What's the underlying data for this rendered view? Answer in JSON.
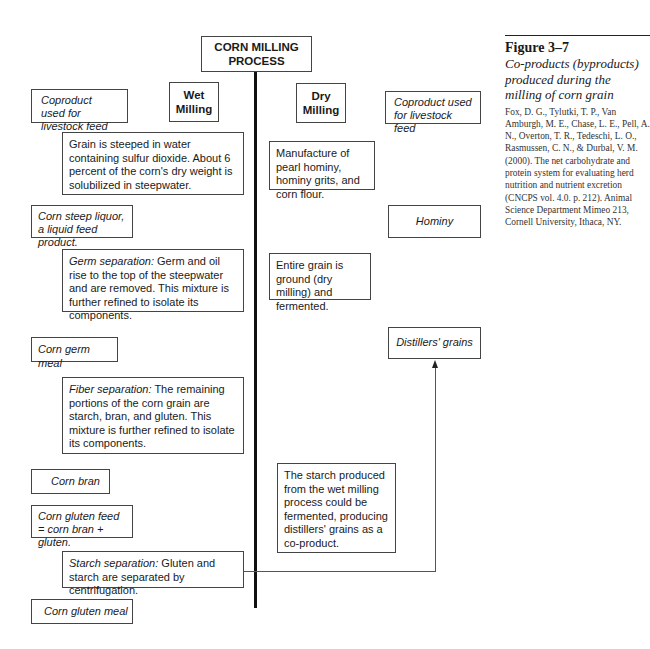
{
  "title": "CORN MILLING PROCESS",
  "wet_heading": "Wet Milling",
  "dry_heading": "Dry Milling",
  "wet": {
    "coproduct_label": "Coproduct used for livestock feed",
    "steps": [
      {
        "lead": "",
        "text": "Grain is steeped in water containing sulfur dioxide.  About 6 percent of the corn's dry weight is solubilized in steepwater."
      },
      {
        "lead": "Germ separation:",
        "text": "  Germ and oil rise to the top of the steepwater and are removed.  This mixture is further refined to isolate its components."
      },
      {
        "lead": "Fiber separation:",
        "text": " The remaining portions of the corn grain are starch, bran, and gluten. This mixture is further refined to isolate its components."
      },
      {
        "lead": "Starch separation:",
        "text": " Gluten and starch are separated by centrifugation."
      }
    ],
    "coproducts": [
      "Corn steep liquor, a liquid feed product.",
      "Corn germ meal",
      "Corn bran",
      "Corn gluten feed = corn bran + gluten.",
      "Corn gluten meal"
    ]
  },
  "dry": {
    "coproduct_label": "Coproduct used for livestock feed",
    "steps": [
      "Manufacture of pearl hominy, hominy grits, and corn flour.",
      "Entire grain is ground (dry milling) and fermented.",
      "The starch produced from the wet milling process could be fermented, producing distillers' grains as a co-product."
    ],
    "coproducts": [
      "Hominy",
      "Distillers' grains"
    ]
  },
  "caption": {
    "figure_number": "Figure 3–7",
    "figure_title": "Co-products (byproducts) produced during the milling of corn grain",
    "citation": "Fox, D. G., Tylutki, T. P., Van Amburgh, M. E., Chase, L. E., Pell, A. N., Overton, T. R., Tedeschi, L. O., Rasmussen, C. N., & Durbal, V. M. (2000). The net carbohydrate and protein system for evaluating herd nutrition and nutrient excretion (CNCPS vol. 4.0. p. 212). Animal Science Department Mimeo 213, Cornell University, Ithaca, NY."
  }
}
